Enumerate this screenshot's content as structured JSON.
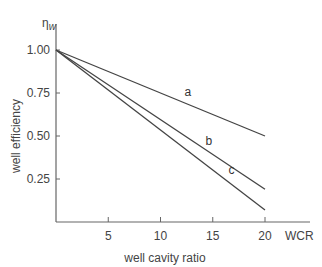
{
  "chart_data": {
    "type": "line",
    "title": "",
    "xlabel": "well cavity ratio",
    "xunit_label": "WCR",
    "ylabel": "well efficiency",
    "ysymbol": "η",
    "ysymbol_sub": "w",
    "xlim": [
      0,
      20
    ],
    "ylim": [
      0,
      1.0
    ],
    "xticks": [
      5,
      10,
      15,
      20
    ],
    "yticks": [
      0.25,
      0.5,
      0.75,
      1.0
    ],
    "ytick_labels": [
      "0.25",
      "0.50",
      "0.75",
      "1.00"
    ],
    "xtick_labels": [
      "5",
      "10",
      "15",
      "20"
    ],
    "grid": false,
    "legend": "inline labels",
    "series": [
      {
        "name": "a",
        "x": [
          0,
          20
        ],
        "values": [
          1.0,
          0.5
        ],
        "label_pos": [
          12.3,
          0.73
        ]
      },
      {
        "name": "b",
        "x": [
          0,
          20
        ],
        "values": [
          1.0,
          0.19
        ],
        "label_pos": [
          14.3,
          0.45
        ]
      },
      {
        "name": "c",
        "x": [
          0,
          20
        ],
        "values": [
          1.0,
          0.07
        ],
        "label_pos": [
          16.5,
          0.28
        ]
      }
    ]
  }
}
